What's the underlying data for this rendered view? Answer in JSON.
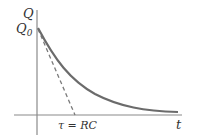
{
  "diagram": {
    "type": "rc-discharge-curve",
    "y_axis_label": "Q",
    "initial_label": "Q",
    "initial_label_subscript": "0",
    "x_axis_label": "t",
    "tau_label": "τ = RC",
    "colors": {
      "curve": "#6b6b6b",
      "axes": "#8a8a8a",
      "tangent": "#7a7a7a",
      "text": "#333333"
    }
  }
}
